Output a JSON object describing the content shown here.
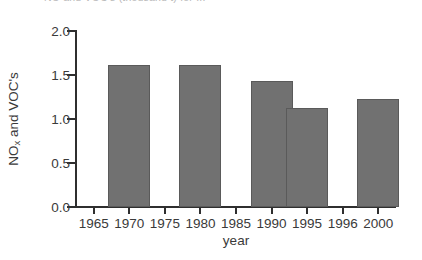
{
  "clipped_title": "NO  and VOC's (thousand t) for ...",
  "chart_data": {
    "type": "bar",
    "title": "",
    "xlabel": "year",
    "ylabel": "NOx and VOC's",
    "ylabel_main": "NO",
    "ylabel_sub": "x",
    "ylabel_rest": " and VOC's",
    "categories": [
      "1965",
      "1970",
      "1975",
      "1980",
      "1985",
      "1990",
      "1995",
      "1996",
      "2000"
    ],
    "values": [
      null,
      1.61,
      null,
      1.61,
      null,
      1.43,
      1.12,
      null,
      1.23
    ],
    "bars": [
      {
        "category": "1970",
        "value": 1.61
      },
      {
        "category": "1980",
        "value": 1.61
      },
      {
        "category": "1990",
        "value": 1.43
      },
      {
        "category": "1995",
        "value": 1.12
      },
      {
        "category": "2000",
        "value": 1.23
      }
    ],
    "ylim": [
      0.0,
      2.0
    ],
    "yticks": [
      "2.0",
      "1.5",
      "1.0",
      "0.5",
      "0.0"
    ],
    "ytick_values": [
      2.0,
      1.5,
      1.0,
      0.5,
      0.0
    ],
    "grid": false,
    "legend": null,
    "bar_color": "#717171",
    "bar_edge_color": "#5a5a5a",
    "axis_color": "#2f2f2f"
  }
}
